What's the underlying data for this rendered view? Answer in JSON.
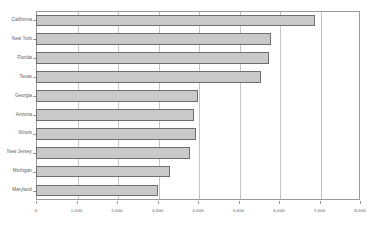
{
  "chart_data": {
    "type": "bar",
    "orientation": "horizontal",
    "title": "",
    "subtitle": "",
    "xlabel": "",
    "ylabel": "",
    "grid": true,
    "legend": false,
    "legend_position": "none",
    "xlim": [
      0,
      8000
    ],
    "xticks": [
      0,
      1000,
      2000,
      3000,
      4000,
      5000,
      6000,
      7000,
      8000
    ],
    "xticklabels": [
      "0",
      "1,000",
      "2,000",
      "3,000",
      "4,000",
      "5,000",
      "6,000",
      "7,000",
      "8,000"
    ],
    "categories": [
      "California",
      "New York",
      "Florida",
      "Texas",
      "Georgia",
      "Arizona",
      "Illinois",
      "New Jersey",
      "Michigan",
      "Maryland"
    ],
    "values": [
      6900,
      5800,
      5750,
      5550,
      4000,
      3900,
      3950,
      3800,
      3300,
      3000
    ],
    "bar_color": "#c9c9c9",
    "bar_border_color": "#6e6e6e",
    "grid_color": "#c4c4c4",
    "axis_color": "#9a9a9a",
    "text_color": "#5a5a5a",
    "background": "#ffffff"
  }
}
